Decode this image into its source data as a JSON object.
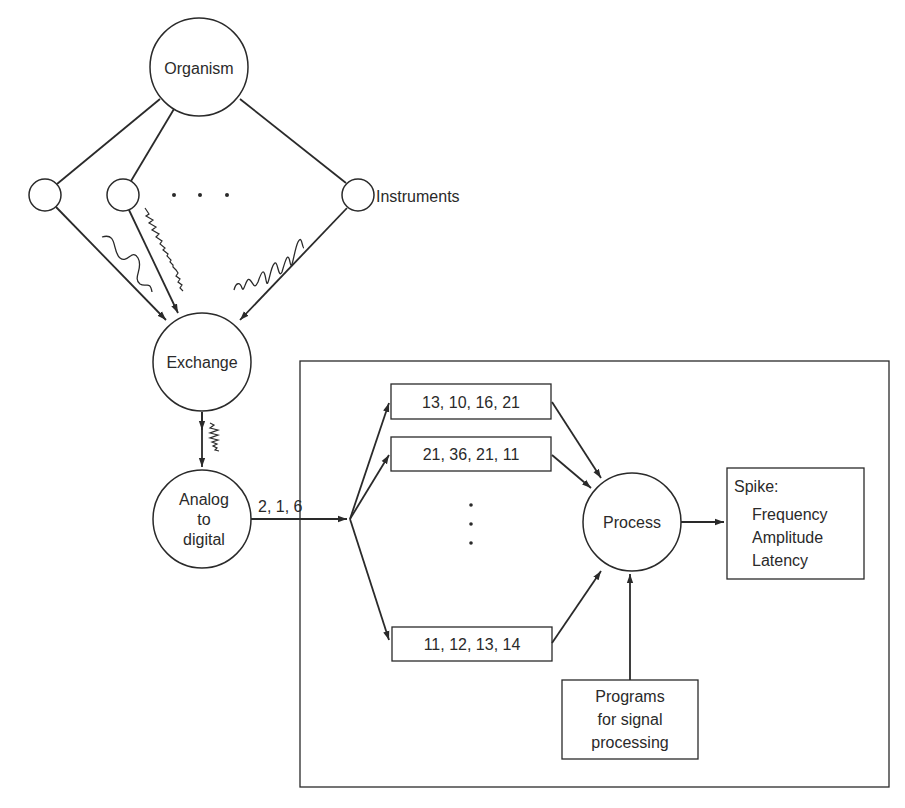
{
  "diagram": {
    "nodes": {
      "organism": {
        "label": "Organism"
      },
      "instruments": {
        "label": "Instruments"
      },
      "instrument_ellipsis": "· · ·",
      "exchange": {
        "label": "Exchange"
      },
      "adc": {
        "lines": [
          "Analog",
          "to",
          "digital"
        ]
      },
      "sample_stream": {
        "label": "2, 1, 6"
      },
      "buffers": [
        {
          "label": "13, 10, 16, 21"
        },
        {
          "label": "21, 36, 21, 11"
        },
        {
          "label": "11, 12, 13, 14"
        }
      ],
      "buffer_ellipsis": [
        "·",
        "·",
        "·"
      ],
      "process": {
        "label": "Process"
      },
      "output": {
        "title": "Spike:",
        "lines": [
          "Frequency",
          "Amplitude",
          "Latency"
        ]
      },
      "programs": {
        "lines": [
          "Programs",
          "for signal",
          "processing"
        ]
      }
    },
    "colors": {
      "stroke": "#2a2a2a",
      "background": "#ffffff",
      "text": "#2a2a2a"
    }
  }
}
